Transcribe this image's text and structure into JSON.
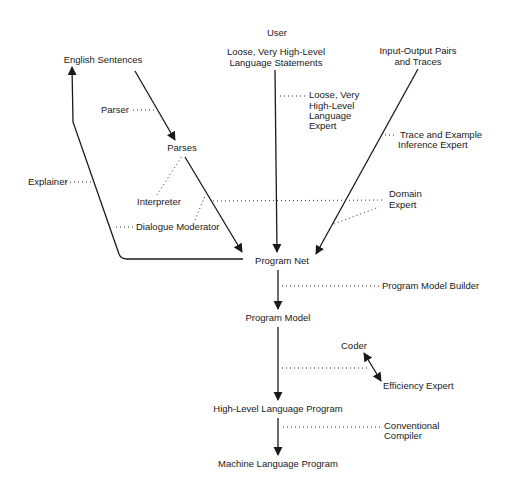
{
  "nodes": {
    "user": "User",
    "loose_statements_1": "Loose, Very High-Level",
    "loose_statements_2": "Language Statements",
    "english_sentences": "English Sentences",
    "io_pairs_1": "Input-Output Pairs",
    "io_pairs_2": "and Traces",
    "parses": "Parses",
    "program_net": "Program Net",
    "program_model": "Program Model",
    "high_level_program": "High-Level Language Program",
    "machine_program": "Machine Language Program"
  },
  "experts": {
    "parser": "Parser",
    "explainer": "Explainer",
    "interpreter": "Interpreter",
    "dialogue_moderator": "Dialogue Moderator",
    "loose_expert_1": "Loose, Very",
    "loose_expert_2": "High-Level",
    "loose_expert_3": "Language",
    "loose_expert_4": "Expert",
    "trace_expert_1": "Trace and Example",
    "trace_expert_2": "Inference Expert",
    "domain_expert_1": "Domain",
    "domain_expert_2": "Expert",
    "program_model_builder": "Program Model Builder",
    "coder": "Coder",
    "efficiency_expert": "Efficiency Expert",
    "compiler_1": "Conventional",
    "compiler_2": "Compiler"
  }
}
